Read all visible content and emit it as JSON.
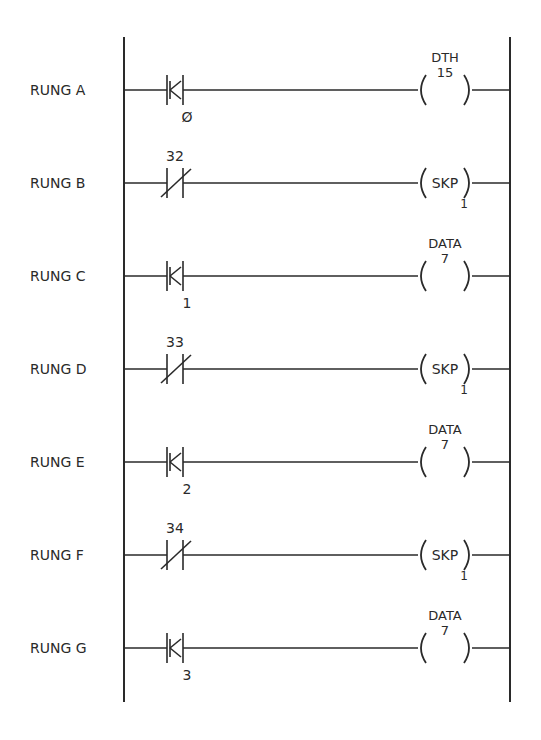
{
  "diagram": {
    "type": "ladder-logic",
    "rails": {
      "left_x": 124,
      "right_x": 510,
      "top_y": 37,
      "bottom_y": 702
    },
    "stroke_color": "#2a2a2a",
    "background": "#ffffff"
  },
  "rungs": [
    {
      "label": "RUNG A",
      "contact": {
        "type": "K",
        "address_above": "",
        "address_below": "0"
      },
      "coil": {
        "type": "function",
        "name": "DTH",
        "value": "15",
        "inner": "",
        "below": ""
      }
    },
    {
      "label": "RUNG B",
      "contact": {
        "type": "normally-closed",
        "address_above": "32",
        "address_below": ""
      },
      "coil": {
        "type": "skip",
        "name": "",
        "value": "",
        "inner": "SKP",
        "below": "1"
      }
    },
    {
      "label": "RUNG C",
      "contact": {
        "type": "K",
        "address_above": "",
        "address_below": "1"
      },
      "coil": {
        "type": "function",
        "name": "DATA",
        "value": "7",
        "inner": "",
        "below": ""
      }
    },
    {
      "label": "RUNG D",
      "contact": {
        "type": "normally-closed",
        "address_above": "33",
        "address_below": ""
      },
      "coil": {
        "type": "skip",
        "name": "",
        "value": "",
        "inner": "SKP",
        "below": "1"
      }
    },
    {
      "label": "RUNG E",
      "contact": {
        "type": "K",
        "address_above": "",
        "address_below": "2"
      },
      "coil": {
        "type": "function",
        "name": "DATA",
        "value": "7",
        "inner": "",
        "below": ""
      }
    },
    {
      "label": "RUNG F",
      "contact": {
        "type": "normally-closed",
        "address_above": "34",
        "address_below": ""
      },
      "coil": {
        "type": "skip",
        "name": "",
        "value": "",
        "inner": "SKP",
        "below": "1"
      }
    },
    {
      "label": "RUNG G",
      "contact": {
        "type": "K",
        "address_above": "",
        "address_below": "3"
      },
      "coil": {
        "type": "function",
        "name": "DATA",
        "value": "7",
        "inner": "",
        "below": ""
      }
    }
  ],
  "zero_glyph": "Ø"
}
